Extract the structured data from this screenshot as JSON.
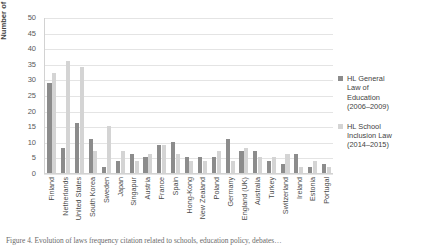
{
  "chart_data": {
    "type": "bar",
    "title": "",
    "xlabel": "",
    "ylabel": "Number of citations",
    "ylim": [
      0,
      50
    ],
    "yticks": [
      0,
      5,
      10,
      15,
      20,
      25,
      30,
      35,
      40,
      45,
      50
    ],
    "grid": true,
    "legend_position": "right",
    "categories": [
      "Finland",
      "Netherlands",
      "United States",
      "South Korea",
      "Sweden",
      "Japan",
      "Singapur",
      "Austria",
      "France",
      "Spain",
      "Hong-Kong",
      "New Zealand",
      "Poland",
      "Germany",
      "England (UK)",
      "Australia",
      "Turkey",
      "Switzerland",
      "Ireland",
      "Estonia",
      "Portugal"
    ],
    "series": [
      {
        "name": "HL General Law of Education (2006–2009)",
        "color": "#8c8c8c",
        "values": [
          29,
          8,
          16,
          11,
          2,
          4,
          6,
          5,
          9,
          10,
          5,
          5,
          5,
          11,
          7,
          7,
          4,
          3,
          6,
          2,
          3
        ]
      },
      {
        "name": "HL School Inclusion Law (2014–2015)",
        "color": "#d4d4d4",
        "values": [
          32,
          36,
          34,
          7,
          15,
          7,
          4,
          6,
          9,
          6,
          4,
          4,
          7,
          4,
          8,
          5,
          5,
          6,
          2,
          4,
          2
        ]
      }
    ]
  },
  "legend": {
    "entries": [
      {
        "label": "HL General\nLaw of\nEducation\n(2006–2009)",
        "swatch": "s0"
      },
      {
        "label": "HL School\nInclusion Law\n(2014–2015)",
        "swatch": "s1"
      }
    ]
  },
  "axis": {
    "y_title": "Number of citations"
  },
  "caption": {
    "text": "Figure 4. Evolution of laws frequency citation related to schools, education policy, debates…"
  },
  "colors": {
    "series_1": "#8c8c8c",
    "series_2": "#d4d4d4",
    "gridline": "#e4e4e4",
    "text": "#3f3f3f",
    "background": "#ffffff"
  }
}
